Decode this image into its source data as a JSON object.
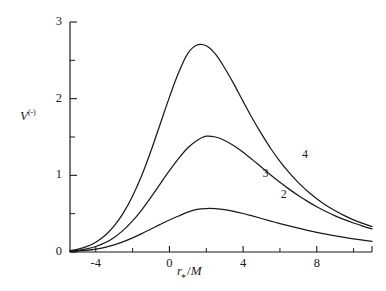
{
  "figure": {
    "background_color": "#ffffff",
    "ink_color": "#1a1a1a"
  },
  "chart_data": {
    "type": "line",
    "title": "",
    "subtitle": "",
    "xlabel": "r_*/M",
    "xlabel_parts": {
      "variable": "r",
      "subscript": "*",
      "slash": "/",
      "denominator": "M"
    },
    "ylabel": "V^(-)",
    "ylabel_parts": {
      "variable": "V",
      "superscript": "(-)"
    },
    "xlim": [
      -5.4,
      11.0
    ],
    "ylim": [
      0,
      3
    ],
    "grid": false,
    "legend": "inline-curve-labels",
    "x_ticks_major": [
      -4,
      0,
      4,
      8
    ],
    "x_tick_labels": [
      "-4",
      "0",
      "4",
      "8"
    ],
    "x_ticks_minor": [
      -2,
      2,
      6,
      10
    ],
    "y_ticks_major": [
      0,
      1,
      2,
      3
    ],
    "y_tick_labels": [
      "0",
      "1",
      "2",
      "3"
    ],
    "y_ticks_minor": [
      0.5,
      1.5,
      2.5
    ],
    "series": [
      {
        "name": "2",
        "label": "2",
        "label_x": 6.05,
        "label_y": 0.74,
        "peak_x": 1.5,
        "peak_y": 0.57,
        "x": [
          -5.4,
          -5.0,
          -4.5,
          -4.0,
          -3.5,
          -3.0,
          -2.5,
          -2.0,
          -1.5,
          -1.0,
          -0.5,
          0.0,
          0.5,
          1.0,
          1.5,
          2.0,
          2.5,
          3.0,
          3.5,
          4.0,
          4.5,
          5.0,
          5.5,
          6.0,
          6.5,
          7.0,
          7.5,
          8.0,
          8.5,
          9.0,
          9.5,
          10.0,
          10.5,
          11.0
        ],
        "y": [
          0.005,
          0.01,
          0.02,
          0.036,
          0.06,
          0.093,
          0.135,
          0.185,
          0.24,
          0.3,
          0.36,
          0.418,
          0.47,
          0.52,
          0.555,
          0.567,
          0.565,
          0.552,
          0.53,
          0.502,
          0.47,
          0.437,
          0.404,
          0.371,
          0.34,
          0.31,
          0.282,
          0.256,
          0.232,
          0.21,
          0.19,
          0.172,
          0.155,
          0.14
        ]
      },
      {
        "name": "3",
        "label": "3",
        "label_x": 5.05,
        "label_y": 1.02,
        "peak_x": 1.0,
        "peak_y": 1.52,
        "x": [
          -5.4,
          -5.0,
          -4.5,
          -4.0,
          -3.5,
          -3.0,
          -2.5,
          -2.0,
          -1.5,
          -1.0,
          -0.5,
          0.0,
          0.5,
          1.0,
          1.5,
          2.0,
          2.5,
          3.0,
          3.5,
          4.0,
          4.5,
          5.0,
          5.5,
          6.0,
          6.5,
          7.0,
          7.5,
          8.0,
          8.5,
          9.0,
          9.5,
          10.0,
          10.5,
          11.0
        ],
        "y": [
          0.01,
          0.02,
          0.04,
          0.072,
          0.12,
          0.19,
          0.285,
          0.405,
          0.55,
          0.715,
          0.89,
          1.06,
          1.22,
          1.36,
          1.455,
          1.51,
          1.5,
          1.455,
          1.385,
          1.3,
          1.205,
          1.105,
          1.005,
          0.91,
          0.82,
          0.736,
          0.66,
          0.59,
          0.528,
          0.472,
          0.422,
          0.378,
          0.338,
          0.302
        ]
      },
      {
        "name": "4",
        "label": "4",
        "label_x": 7.2,
        "label_y": 1.27,
        "peak_x": 0.7,
        "peak_y": 2.7,
        "x": [
          -5.4,
          -5.0,
          -4.5,
          -4.0,
          -3.5,
          -3.0,
          -2.5,
          -2.0,
          -1.5,
          -1.0,
          -0.5,
          0.0,
          0.5,
          1.0,
          1.5,
          2.0,
          2.5,
          3.0,
          3.5,
          4.0,
          4.5,
          5.0,
          5.5,
          6.0,
          6.5,
          7.0,
          7.5,
          8.0,
          8.5,
          9.0,
          9.5,
          10.0,
          10.5,
          11.0
        ],
        "y": [
          0.018,
          0.035,
          0.07,
          0.128,
          0.215,
          0.34,
          0.51,
          0.73,
          1.0,
          1.32,
          1.67,
          2.02,
          2.34,
          2.59,
          2.7,
          2.69,
          2.58,
          2.4,
          2.19,
          1.965,
          1.745,
          1.54,
          1.35,
          1.182,
          1.035,
          0.905,
          0.792,
          0.695,
          0.61,
          0.538,
          0.475,
          0.42,
          0.373,
          0.332
        ]
      }
    ]
  }
}
